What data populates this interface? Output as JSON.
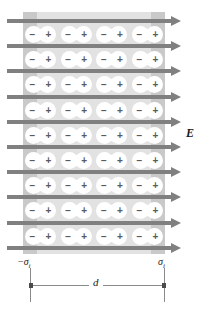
{
  "figure": {
    "type": "physics-diagram"
  },
  "field": {
    "label": "E",
    "arrow_count": 10,
    "direction": "right",
    "color": "#808080"
  },
  "slab": {
    "fill_color": "#e2e2e2",
    "edge_color": "#c9c9c9",
    "rows": 9,
    "dipoles_per_row": 4
  },
  "dipole": {
    "negative_sign": "−",
    "positive_sign": "+",
    "body_color": "#ffffff",
    "sign_color": "#5a5a5a"
  },
  "labels": {
    "sigma_left_prefix": "−",
    "sigma_symbol": "σ",
    "sigma_subscript": "i",
    "distance": "d"
  },
  "chart_data": {
    "type": "diagram",
    "field_lines": 10,
    "dipole_rows": 9,
    "dipoles_per_row": 4,
    "total_dipoles": 36
  }
}
